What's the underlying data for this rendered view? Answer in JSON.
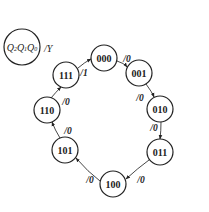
{
  "legend": {
    "state_vars": [
      "Q2",
      "Q1",
      "Q0"
    ],
    "output_label": "/Y"
  },
  "states": [
    {
      "id": "s000",
      "label": "000",
      "x": 104,
      "y": 58
    },
    {
      "id": "s001",
      "label": "001",
      "x": 139,
      "y": 73
    },
    {
      "id": "s010",
      "label": "010",
      "x": 160,
      "y": 109
    },
    {
      "id": "s011",
      "label": "011",
      "x": 160,
      "y": 152
    },
    {
      "id": "s100",
      "label": "100",
      "x": 113,
      "y": 184
    },
    {
      "id": "s101",
      "label": "101",
      "x": 65,
      "y": 150
    },
    {
      "id": "s110",
      "label": "110",
      "x": 47,
      "y": 110
    },
    {
      "id": "s111",
      "label": "111",
      "x": 66,
      "y": 75
    }
  ],
  "transitions": [
    {
      "from": "000",
      "to": "001",
      "label": "/0"
    },
    {
      "from": "001",
      "to": "010",
      "label": "/0"
    },
    {
      "from": "010",
      "to": "011",
      "label": "/0"
    },
    {
      "from": "011",
      "to": "100",
      "label": "/0"
    },
    {
      "from": "100",
      "to": "101",
      "label": "/0"
    },
    {
      "from": "101",
      "to": "110",
      "label": "/0"
    },
    {
      "from": "110",
      "to": "111",
      "label": "/0"
    },
    {
      "from": "111",
      "to": "000",
      "label": "/1"
    }
  ]
}
